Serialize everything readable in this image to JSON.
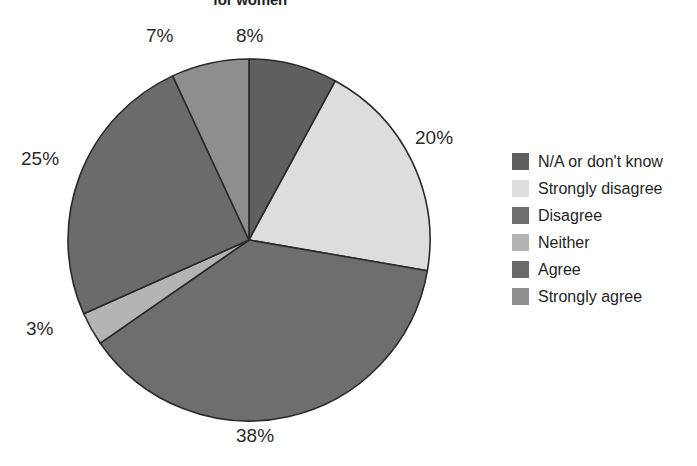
{
  "chart_data": {
    "type": "pie",
    "title": "for women",
    "title_note": "title is clipped by the top edge of the screenshot",
    "xlabel": "",
    "ylabel": "",
    "legend_position": "right",
    "grid": false,
    "start_angle_deg": 0,
    "direction": "clockwise",
    "categories": [
      "N/A or don't know",
      "Strongly disagree",
      "Disagree",
      "Neither",
      "Agree",
      "Strongly agree"
    ],
    "values": [
      8,
      20,
      38,
      3,
      25,
      7
    ],
    "value_labels": [
      "8%",
      "20%",
      "38%",
      "3%",
      "25%",
      "7%"
    ],
    "colors": [
      "#5f5f5f",
      "#dddddd",
      "#6e6e6e",
      "#b4b4b4",
      "#6b6b6b",
      "#8e8e8e"
    ],
    "slice_border_color": "#2a2a2a",
    "slices": [
      {
        "label": "N/A or don't know",
        "value": 8,
        "display": "8%",
        "color": "#5f5f5f"
      },
      {
        "label": "Strongly disagree",
        "value": 20,
        "display": "20%",
        "color": "#dddddd"
      },
      {
        "label": "Disagree",
        "value": 38,
        "display": "38%",
        "color": "#6e6e6e"
      },
      {
        "label": "Neither",
        "value": 3,
        "display": "3%",
        "color": "#b4b4b4"
      },
      {
        "label": "Agree",
        "value": 25,
        "display": "25%",
        "color": "#6b6b6b"
      },
      {
        "label": "Strongly agree",
        "value": 7,
        "display": "7%",
        "color": "#8e8e8e"
      }
    ]
  },
  "legend": {
    "items": [
      {
        "label": "N/A or don't know",
        "color": "#5f5f5f"
      },
      {
        "label": "Strongly disagree",
        "color": "#dddddd"
      },
      {
        "label": "Disagree",
        "color": "#6e6e6e"
      },
      {
        "label": "Neither",
        "color": "#b4b4b4"
      },
      {
        "label": "Agree",
        "color": "#6b6b6b"
      },
      {
        "label": "Strongly agree",
        "color": "#8e8e8e"
      }
    ]
  }
}
